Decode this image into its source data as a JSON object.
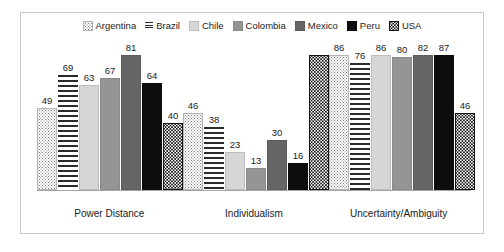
{
  "chart_data": {
    "type": "bar",
    "title": "",
    "subtitle": "",
    "xlabel": "",
    "ylabel": "",
    "ylim": [
      0,
      100
    ],
    "grid": false,
    "legend_position": "top-center",
    "categories": [
      "Power Distance",
      "Individualism",
      "Uncertainty/Ambiguity"
    ],
    "series": [
      {
        "name": "Argentina",
        "swatch": "light-stipple-dots",
        "values": [
          49,
          46,
          86
        ],
        "labels": [
          "49",
          "46",
          "86"
        ]
      },
      {
        "name": "Brazil",
        "swatch": "horizontal-hatch-lines",
        "values": [
          69,
          38,
          76
        ],
        "labels": [
          "69",
          "38",
          "76"
        ]
      },
      {
        "name": "Chile",
        "swatch": "light-gray-solid",
        "values": [
          63,
          23,
          86
        ],
        "labels": [
          "63",
          "23",
          "86"
        ]
      },
      {
        "name": "Colombia",
        "swatch": "medium-gray-solid",
        "values": [
          67,
          13,
          80
        ],
        "labels": [
          "67",
          "13",
          "80"
        ]
      },
      {
        "name": "Mexico",
        "swatch": "dark-gray-solid",
        "values": [
          81,
          30,
          82
        ],
        "labels": [
          "81",
          "30",
          "82"
        ]
      },
      {
        "name": "Peru",
        "swatch": "black-solid",
        "values": [
          64,
          16,
          87
        ],
        "labels": [
          "64",
          "16",
          "87"
        ]
      },
      {
        "name": "USA",
        "swatch": "black-with-white-dots",
        "values": [
          40,
          91,
          46
        ],
        "labels": [
          "40",
          "",
          "46"
        ]
      }
    ]
  },
  "legend": {
    "items": [
      {
        "label": "Argentina"
      },
      {
        "label": "Brazil"
      },
      {
        "label": "Chile"
      },
      {
        "label": "Colombia"
      },
      {
        "label": "Mexico"
      },
      {
        "label": "Peru"
      },
      {
        "label": "USA"
      }
    ]
  },
  "axis": {
    "category_labels": [
      "Power Distance",
      "Individualism",
      "Uncertainty/Ambiguity"
    ]
  },
  "colors": {
    "frame_border": "#c8c8c8",
    "axis_line": "#a6a6a6",
    "text": "#1a1a1a",
    "chile": "#d6d6d6",
    "colombia": "#959595",
    "mexico": "#666666",
    "peru": "#0d0d0d",
    "usa": "#141414"
  }
}
